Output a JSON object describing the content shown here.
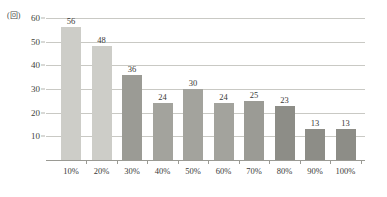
{
  "chart_data": {
    "type": "bar",
    "title": "",
    "subtitle": "",
    "xlabel": "",
    "ylabel": "(回)",
    "ylim": [
      0,
      60
    ],
    "yticks": [
      60,
      50,
      40,
      30,
      20,
      10
    ],
    "grid": true,
    "legend": false,
    "legend_position": "none",
    "categories": [
      "10%",
      "20%",
      "30%",
      "40%",
      "50%",
      "60%",
      "70%",
      "80%",
      "90%",
      "100%"
    ],
    "values": [
      56,
      48,
      36,
      24,
      30,
      24,
      25,
      23,
      13,
      13
    ],
    "value_labels": [
      "56",
      "48",
      "36",
      "24",
      "30",
      "24",
      "25",
      "23",
      "13",
      "13"
    ],
    "bar_colors": [
      "#cdcdc8",
      "#cdcdc8",
      "#9b9b95",
      "#a3a39d",
      "#a3a39d",
      "#a3a39d",
      "#9b9b95",
      "#8d8d87",
      "#8d8d87",
      "#8d8d87"
    ],
    "axis_color": "#9a9a94",
    "gridline_color": "#c9c9c4",
    "text_color": "#3a3a38"
  }
}
